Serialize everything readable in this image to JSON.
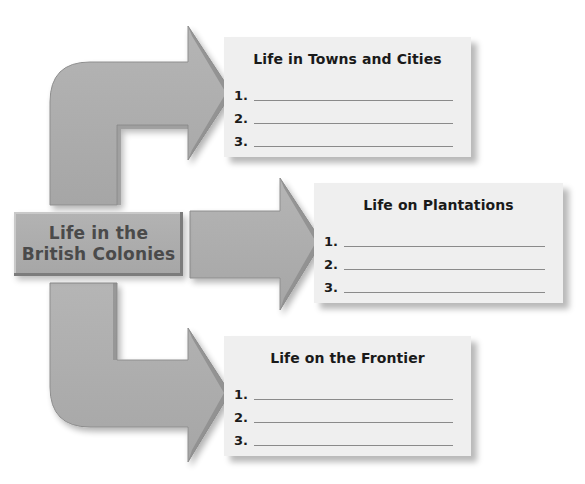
{
  "header": {
    "cut_off_text": "your notes page... the ... to organize information about"
  },
  "center": {
    "line1": "Life in the",
    "line2": "British Colonies"
  },
  "cards": [
    {
      "title": "Life in Towns and Cities",
      "items": [
        {
          "number": "1.",
          "value": ""
        },
        {
          "number": "2.",
          "value": ""
        },
        {
          "number": "3.",
          "value": ""
        }
      ]
    },
    {
      "title": "Life on Plantations",
      "items": [
        {
          "number": "1.",
          "value": ""
        },
        {
          "number": "2.",
          "value": ""
        },
        {
          "number": "3.",
          "value": ""
        }
      ]
    },
    {
      "title": "Life on the Frontier",
      "items": [
        {
          "number": "1.",
          "value": ""
        },
        {
          "number": "2.",
          "value": ""
        },
        {
          "number": "3.",
          "value": ""
        }
      ]
    }
  ],
  "colors": {
    "arrow_fill": "#ababab",
    "arrow_shade": "#8c8c8c",
    "card_bg": "#efefef",
    "center_box": "#adadad",
    "center_text": "#4a4a4a"
  }
}
